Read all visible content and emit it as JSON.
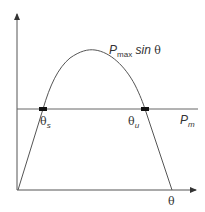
{
  "diagram": {
    "type": "power-angle curve",
    "curve_label": {
      "main": "P",
      "subscript": "max",
      "suffix": "sin",
      "symbol": "θ"
    },
    "mechanical_power_label": {
      "main": "P",
      "subscript": "m"
    },
    "stable_point_label": {
      "symbol": "θ",
      "subscript": "s"
    },
    "unstable_point_label": {
      "symbol": "θ",
      "subscript": "u"
    },
    "x_axis_label": "θ",
    "colors": {
      "line": "#555555",
      "marker": "#111111",
      "text": "#333333"
    }
  }
}
